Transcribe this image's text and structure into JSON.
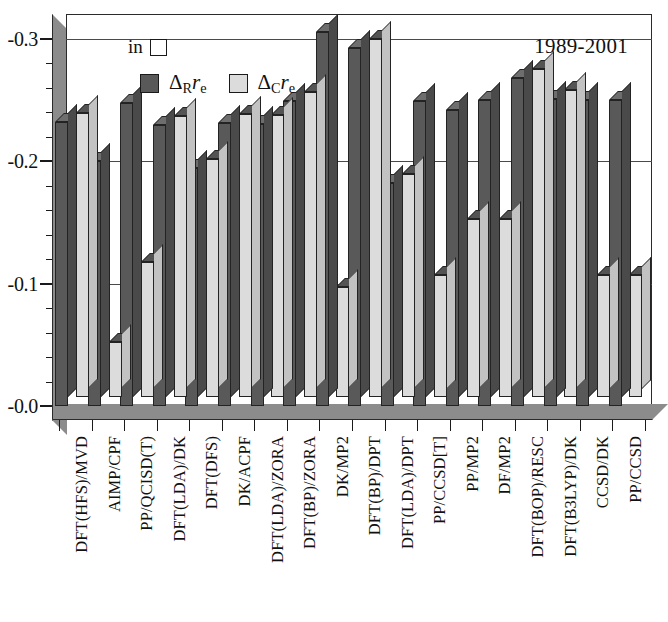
{
  "legend": {
    "units_prefix": "in",
    "units_symbol_box": "□",
    "series": [
      {
        "key": "delta_R",
        "label_prefix": "Δ",
        "label_sub": "R",
        "label_italic": "r",
        "label_subscript2": "e",
        "color": "#595959"
      },
      {
        "key": "delta_C",
        "label_prefix": "Δ",
        "label_sub": "C",
        "label_italic": "r",
        "label_subscript2": "e",
        "color": "#dcdcdc"
      }
    ]
  },
  "period_label": "1989-2001",
  "axes": {
    "y_ticks": [
      "-0.3",
      "-0.2",
      "-0.1",
      "-0.0"
    ],
    "y_tick_values": [
      -0.3,
      -0.2,
      -0.1,
      0.0
    ],
    "ylim": [
      0.0,
      -0.32
    ],
    "gridlines": true
  },
  "chart_data": {
    "type": "bar",
    "title": "",
    "subtitle": "1989-2001",
    "xlabel": "",
    "ylabel": "",
    "ylim": [
      0.0,
      -0.32
    ],
    "yticks": [
      -0.0,
      -0.1,
      -0.2,
      -0.3
    ],
    "grid": true,
    "legend_position": "top-left",
    "units": "in □",
    "categories": [
      "DFT(HFS)/MVD",
      "AIMP/CPF",
      "PP/QCISD(T)",
      "DFT(LDA)/DK",
      "DFT(DFS)",
      "DK/ACPF",
      "DFT(LDA)/ZORA",
      "DFT(BP)/ZORA",
      "DK/MP2",
      "DFT(BP)/DPT",
      "DFT(LDA)/DPT",
      "PP/CCSD[T]",
      "PP/MP2",
      "DF/MP2",
      "DFT(BOP)/RESC",
      "DFT(B3LYP)/DK",
      "CCSD/DK",
      "PP/CCSD"
    ],
    "series": [
      {
        "name": "ΔR re",
        "color": "#595959",
        "values": [
          -0.232,
          -0.2,
          -0.247,
          -0.229,
          -0.194,
          -0.231,
          -0.23,
          -0.249,
          -0.305,
          -0.292,
          -0.182,
          -0.249,
          -0.242,
          -0.25,
          -0.268,
          -0.251,
          -0.25,
          -0.25
        ]
      },
      {
        "name": "ΔC re",
        "color": "#dcdcdc",
        "values": [
          -0.232,
          -0.045,
          -0.11,
          -0.229,
          -0.194,
          -0.231,
          -0.23,
          -0.249,
          -0.09,
          -0.292,
          -0.182,
          -0.1,
          -0.145,
          -0.145,
          -0.268,
          -0.251,
          -0.1,
          -0.1
        ]
      }
    ]
  }
}
